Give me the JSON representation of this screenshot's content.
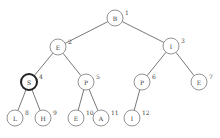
{
  "diagram": {
    "type": "binary-tree",
    "nodes": [
      {
        "id": 1,
        "label": "B",
        "index": "1",
        "x": 115,
        "y": 18,
        "highlight": false
      },
      {
        "id": 2,
        "label": "E",
        "index": "2",
        "x": 58,
        "y": 47,
        "highlight": false
      },
      {
        "id": 3,
        "label": "I",
        "index": "3",
        "x": 171,
        "y": 46,
        "highlight": false
      },
      {
        "id": 4,
        "label": "S",
        "index": "4",
        "x": 29,
        "y": 82,
        "highlight": true
      },
      {
        "id": 5,
        "label": "P",
        "index": "5",
        "x": 86,
        "y": 82,
        "highlight": false
      },
      {
        "id": 6,
        "label": "P",
        "index": "6",
        "x": 142,
        "y": 82,
        "highlight": false
      },
      {
        "id": 7,
        "label": "E",
        "index": "7",
        "x": 199,
        "y": 82,
        "highlight": false
      },
      {
        "id": 8,
        "label": "L",
        "index": "8",
        "x": 15,
        "y": 118,
        "highlight": false
      },
      {
        "id": 9,
        "label": "H",
        "index": "9",
        "x": 43,
        "y": 118,
        "highlight": false
      },
      {
        "id": 10,
        "label": "E",
        "index": "10",
        "x": 76,
        "y": 118,
        "highlight": false
      },
      {
        "id": 11,
        "label": "A",
        "index": "11",
        "x": 101,
        "y": 118,
        "highlight": false
      },
      {
        "id": 12,
        "label": "I",
        "index": "12",
        "x": 132,
        "y": 118,
        "highlight": false
      }
    ],
    "edges": [
      [
        1,
        2
      ],
      [
        1,
        3
      ],
      [
        2,
        4
      ],
      [
        2,
        5
      ],
      [
        3,
        6
      ],
      [
        3,
        7
      ],
      [
        4,
        8
      ],
      [
        4,
        9
      ],
      [
        5,
        10
      ],
      [
        5,
        11
      ],
      [
        6,
        12
      ]
    ],
    "node_radius": 8
  }
}
